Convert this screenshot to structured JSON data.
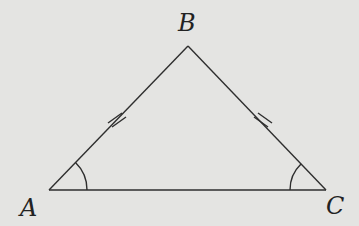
{
  "diagram": {
    "type": "isosceles triangle",
    "background": "#e4e4e2",
    "line_color": "#2e2e2e",
    "vertices": {
      "A": {
        "label": "A",
        "x": 49,
        "y": 190
      },
      "B": {
        "label": "B",
        "x": 188,
        "y": 46
      },
      "C": {
        "label": "C",
        "x": 326,
        "y": 190
      }
    },
    "equal_sides": [
      "AB",
      "BC"
    ],
    "equal_angles": [
      "A",
      "C"
    ],
    "tick_marks_per_side": 2
  }
}
